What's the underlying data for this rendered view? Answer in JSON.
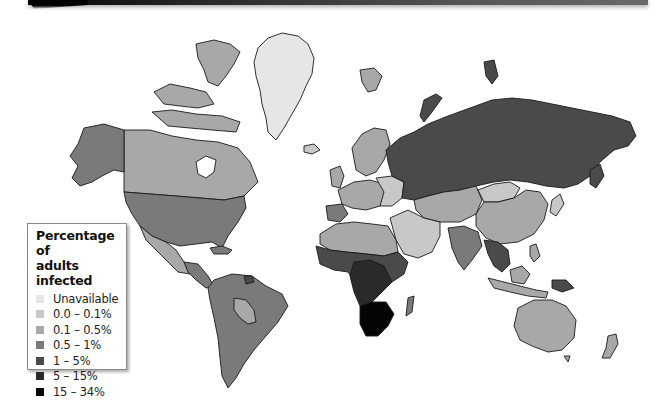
{
  "banner": {
    "colors": [
      "#050505",
      "#6a6a6a"
    ]
  },
  "legend": {
    "title_line1": "Percentage of",
    "title_line2": "adults infected",
    "items": [
      {
        "label": "Unavailable",
        "color": "#e6e6e6"
      },
      {
        "label": "0.0 – 0.1%",
        "color": "#c8c8c8"
      },
      {
        "label": "0.1 – 0.5%",
        "color": "#a8a8a8"
      },
      {
        "label": "0.5 – 1%",
        "color": "#7a7a7a"
      },
      {
        "label": "1 – 5%",
        "color": "#4a4a4a"
      },
      {
        "label": "5 – 15%",
        "color": "#2a2a2a"
      },
      {
        "label": "15 – 34%",
        "color": "#050505"
      }
    ]
  },
  "map": {
    "type": "choropleth",
    "subject": "Percentage of adults infected",
    "regions": [
      {
        "name": "Greenland",
        "class": "Unavailable"
      },
      {
        "name": "Canada",
        "class": "0.1 – 0.5%"
      },
      {
        "name": "Alaska / USA",
        "class": "0.5 – 1%"
      },
      {
        "name": "Mexico",
        "class": "0.1 – 0.5%"
      },
      {
        "name": "Central America",
        "class": "0.5 – 1%"
      },
      {
        "name": "South America",
        "class": "0.5 – 1%"
      },
      {
        "name": "Bolivia / Paraguay",
        "class": "0.1 – 0.5%"
      },
      {
        "name": "Guyana / Suriname",
        "class": "1 – 5%"
      },
      {
        "name": "Iceland",
        "class": "0.0 – 0.1%"
      },
      {
        "name": "Scandinavia",
        "class": "0.1 – 0.5%"
      },
      {
        "name": "Western Europe",
        "class": "0.1 – 0.5%"
      },
      {
        "name": "Spain / Portugal",
        "class": "0.5 – 1%"
      },
      {
        "name": "Eastern Europe",
        "class": "0.0 – 0.1%"
      },
      {
        "name": "Russia",
        "class": "1 – 5%"
      },
      {
        "name": "Central Asia",
        "class": "0.1 – 0.5%"
      },
      {
        "name": "Mongolia",
        "class": "0.0 – 0.1%"
      },
      {
        "name": "China",
        "class": "0.1 – 0.5%"
      },
      {
        "name": "Middle East",
        "class": "0.0 – 0.1%"
      },
      {
        "name": "North Africa",
        "class": "0.1 – 0.5%"
      },
      {
        "name": "India",
        "class": "0.5 – 1%"
      },
      {
        "name": "Southeast Asia",
        "class": "1 – 5%"
      },
      {
        "name": "Indonesia",
        "class": "0.1 – 0.5%"
      },
      {
        "name": "Papua New Guinea",
        "class": "1 – 5%"
      },
      {
        "name": "West / Central Africa",
        "class": "1 – 5%"
      },
      {
        "name": "East Africa",
        "class": "5 – 15%"
      },
      {
        "name": "Southern Africa",
        "class": "15 – 34%"
      },
      {
        "name": "Madagascar",
        "class": "0.5 – 1%"
      },
      {
        "name": "Japan",
        "class": "0.0 – 0.1%"
      },
      {
        "name": "Australia",
        "class": "0.1 – 0.5%"
      },
      {
        "name": "New Zealand",
        "class": "0.1 – 0.5%"
      }
    ]
  }
}
